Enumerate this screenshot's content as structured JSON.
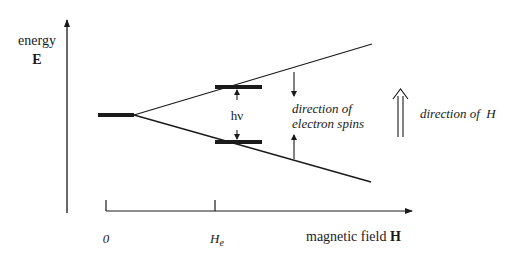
{
  "diagram": {
    "type": "zeeman-splitting-energy-diagram",
    "y_axis": {
      "label_line1": "energy",
      "label_line2": "E"
    },
    "x_axis": {
      "label": "magnetic field ",
      "label_symbol": "H",
      "ticks": [
        {
          "label": "0",
          "sub": ""
        },
        {
          "label": "H",
          "sub": "e"
        }
      ]
    },
    "transition_label": "hν",
    "spin_label_line1": "direction of",
    "spin_label_line2": "electron spins",
    "field_direction_label": "direction of  H",
    "colors": {
      "ink": "#1a1a1a",
      "background": "#ffffff"
    }
  }
}
